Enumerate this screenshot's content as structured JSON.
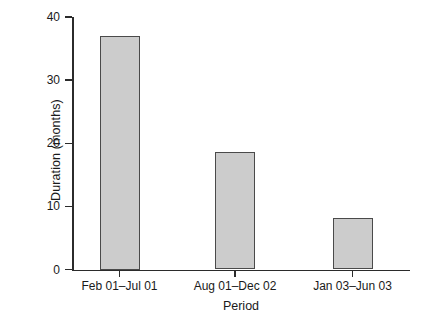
{
  "chart_data": {
    "type": "bar",
    "title": "",
    "xlabel": "Period",
    "ylabel": "Duration (months)",
    "categories": [
      "Feb 01–Jul 01",
      "Aug 01–Dec 02",
      "Jan 03–Jun 03"
    ],
    "values": [
      37,
      18.6,
      8.1
    ],
    "ylim": [
      0,
      40
    ],
    "yticks": [
      "0",
      "10",
      "20",
      "30",
      "40"
    ],
    "ytick_values": [
      0,
      10,
      20,
      30,
      40
    ],
    "grid": false,
    "legend": null,
    "bar_color": "#cccccc",
    "bar_edge_color": "#4a4a4a",
    "axis_color": "#2b2b2b"
  }
}
